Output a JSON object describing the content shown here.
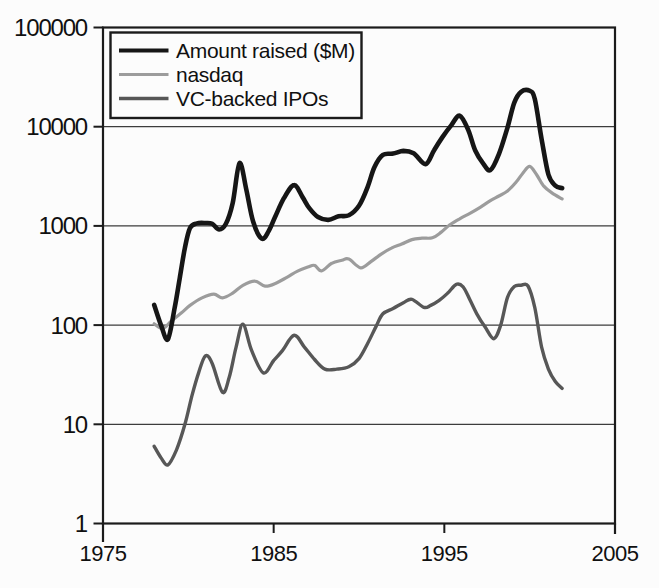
{
  "colors": {
    "background": "#fcfcfc",
    "frame": "#1b1b1b",
    "grid": "#3c3c3c",
    "text": "#101010",
    "legend_background": "#fcfcfc"
  },
  "chart_data": {
    "type": "line",
    "title": "",
    "xlabel": "",
    "ylabel": "",
    "grid": {
      "horizontal": true,
      "vertical": false
    },
    "x_axis": {
      "min": 1975,
      "max": 2005,
      "ticks": [
        1975,
        1985,
        1995,
        2005
      ],
      "tick_labels": [
        "1975",
        "1985",
        "1995",
        "2005"
      ],
      "inner_ticks": [
        1985,
        1995
      ]
    },
    "y_axis": {
      "scale": "log",
      "min": 1,
      "max": 100000,
      "ticks": [
        1,
        10,
        100,
        1000,
        10000,
        100000
      ],
      "tick_labels": [
        "1",
        "10",
        "100",
        "1000",
        "10000",
        "100000"
      ]
    },
    "legend": {
      "position": "top-left",
      "entries": [
        "Amount raised ($M)",
        "nasdaq",
        "VC-backed IPOs"
      ]
    },
    "series": [
      {
        "name": "Amount raised ($M)",
        "color": "#161616",
        "stroke_width": 4.6,
        "points": [
          [
            1978.0,
            160
          ],
          [
            1978.4,
            100
          ],
          [
            1978.8,
            72
          ],
          [
            1979.2,
            150
          ],
          [
            1979.5,
            300
          ],
          [
            1979.8,
            600
          ],
          [
            1980.1,
            950
          ],
          [
            1980.5,
            1060
          ],
          [
            1981.0,
            1070
          ],
          [
            1981.4,
            1050
          ],
          [
            1981.8,
            920
          ],
          [
            1982.2,
            1050
          ],
          [
            1982.6,
            1700
          ],
          [
            1983.0,
            4300
          ],
          [
            1983.4,
            2300
          ],
          [
            1983.8,
            1100
          ],
          [
            1984.3,
            745
          ],
          [
            1984.7,
            880
          ],
          [
            1985.1,
            1250
          ],
          [
            1985.6,
            1900
          ],
          [
            1986.2,
            2580
          ],
          [
            1986.7,
            1940
          ],
          [
            1987.1,
            1500
          ],
          [
            1987.6,
            1230
          ],
          [
            1988.2,
            1150
          ],
          [
            1988.8,
            1250
          ],
          [
            1989.4,
            1280
          ],
          [
            1990.0,
            1600
          ],
          [
            1990.5,
            2450
          ],
          [
            1990.9,
            3900
          ],
          [
            1991.4,
            5200
          ],
          [
            1992.0,
            5350
          ],
          [
            1992.6,
            5700
          ],
          [
            1993.2,
            5400
          ],
          [
            1993.9,
            4200
          ],
          [
            1994.4,
            5800
          ],
          [
            1994.9,
            7900
          ],
          [
            1995.4,
            10300
          ],
          [
            1995.9,
            12900
          ],
          [
            1996.4,
            9300
          ],
          [
            1996.8,
            5800
          ],
          [
            1997.3,
            4200
          ],
          [
            1997.7,
            3650
          ],
          [
            1998.2,
            5300
          ],
          [
            1998.7,
            9800
          ],
          [
            1999.1,
            17500
          ],
          [
            1999.5,
            22500
          ],
          [
            2000.0,
            23000
          ],
          [
            2000.3,
            19000
          ],
          [
            2000.7,
            7500
          ],
          [
            2001.1,
            3300
          ],
          [
            2001.5,
            2550
          ],
          [
            2001.9,
            2400
          ]
        ]
      },
      {
        "name": "nasdaq",
        "color": "#9c9c9c",
        "stroke_width": 3.2,
        "points": [
          [
            1978.0,
            103
          ],
          [
            1978.5,
            92
          ],
          [
            1979.0,
            110
          ],
          [
            1979.6,
            133
          ],
          [
            1980.1,
            158
          ],
          [
            1980.8,
            188
          ],
          [
            1981.5,
            205
          ],
          [
            1982.0,
            188
          ],
          [
            1982.6,
            210
          ],
          [
            1983.2,
            252
          ],
          [
            1983.9,
            278
          ],
          [
            1984.5,
            247
          ],
          [
            1985.1,
            263
          ],
          [
            1985.8,
            305
          ],
          [
            1986.4,
            350
          ],
          [
            1987.0,
            385
          ],
          [
            1987.4,
            400
          ],
          [
            1987.8,
            352
          ],
          [
            1988.4,
            420
          ],
          [
            1989.0,
            450
          ],
          [
            1989.4,
            463
          ],
          [
            1990.1,
            378
          ],
          [
            1990.7,
            437
          ],
          [
            1991.3,
            520
          ],
          [
            1991.9,
            598
          ],
          [
            1992.5,
            655
          ],
          [
            1993.1,
            728
          ],
          [
            1993.7,
            752
          ],
          [
            1994.3,
            758
          ],
          [
            1994.8,
            860
          ],
          [
            1995.3,
            1020
          ],
          [
            1995.9,
            1180
          ],
          [
            1996.5,
            1340
          ],
          [
            1997.1,
            1540
          ],
          [
            1997.7,
            1800
          ],
          [
            1998.2,
            2000
          ],
          [
            1998.7,
            2250
          ],
          [
            1999.2,
            2750
          ],
          [
            1999.6,
            3400
          ],
          [
            2000.0,
            3980
          ],
          [
            2000.4,
            3300
          ],
          [
            2000.8,
            2550
          ],
          [
            2001.3,
            2150
          ],
          [
            2001.9,
            1870
          ]
        ]
      },
      {
        "name": "VC-backed IPOs",
        "color": "#575757",
        "stroke_width": 3.4,
        "points": [
          [
            1978.0,
            6
          ],
          [
            1978.4,
            4.6
          ],
          [
            1978.8,
            3.9
          ],
          [
            1979.3,
            5.5
          ],
          [
            1979.8,
            10
          ],
          [
            1980.2,
            19
          ],
          [
            1980.6,
            33
          ],
          [
            1981.0,
            49
          ],
          [
            1981.4,
            41
          ],
          [
            1982.0,
            21
          ],
          [
            1982.4,
            30
          ],
          [
            1982.8,
            60
          ],
          [
            1983.2,
            102
          ],
          [
            1983.7,
            56
          ],
          [
            1984.4,
            33
          ],
          [
            1985.0,
            44
          ],
          [
            1985.5,
            55
          ],
          [
            1986.2,
            79
          ],
          [
            1986.8,
            60
          ],
          [
            1987.4,
            45
          ],
          [
            1988.0,
            36
          ],
          [
            1988.7,
            36
          ],
          [
            1989.4,
            38
          ],
          [
            1990.0,
            46
          ],
          [
            1990.5,
            65
          ],
          [
            1991.0,
            97
          ],
          [
            1991.4,
            130
          ],
          [
            1992.0,
            147
          ],
          [
            1992.6,
            168
          ],
          [
            1993.1,
            182
          ],
          [
            1993.8,
            151
          ],
          [
            1994.2,
            158
          ],
          [
            1994.7,
            178
          ],
          [
            1995.2,
            210
          ],
          [
            1995.7,
            258
          ],
          [
            1996.1,
            243
          ],
          [
            1996.5,
            180
          ],
          [
            1996.9,
            130
          ],
          [
            1997.4,
            95
          ],
          [
            1997.9,
            73
          ],
          [
            1998.3,
            100
          ],
          [
            1998.7,
            190
          ],
          [
            1999.1,
            245
          ],
          [
            1999.5,
            252
          ],
          [
            1999.9,
            248
          ],
          [
            2000.3,
            150
          ],
          [
            2000.7,
            60
          ],
          [
            2001.1,
            36
          ],
          [
            2001.5,
            27
          ],
          [
            2001.9,
            23
          ]
        ]
      }
    ]
  }
}
